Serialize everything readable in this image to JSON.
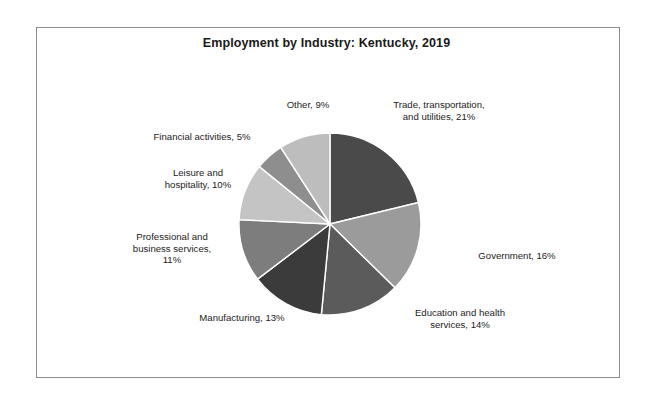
{
  "chart_data": {
    "type": "pie",
    "title": "Employment by Industry: Kentucky, 2019",
    "xlabel": "",
    "ylabel": "",
    "legend_position": "none",
    "grid": false,
    "labels_outside": true,
    "start_angle_deg": 0,
    "direction": "clockwise",
    "categories": [
      "Trade, transportation, and utilities",
      "Government",
      "Education and health services",
      "Manufacturing",
      "Professional and business services",
      "Leisure and hospitality",
      "Financial activities",
      "Other"
    ],
    "values": [
      21,
      16,
      14,
      13,
      11,
      10,
      5,
      9
    ],
    "unit": "%",
    "slices": [
      {
        "name": "trade-transportation-utilities",
        "label": "Trade, transportation,\nand utilities, 21%",
        "category": "Trade, transportation, and utilities",
        "value": 21,
        "color": "#4a4a4a"
      },
      {
        "name": "government",
        "label": "Government, 16%",
        "category": "Government",
        "value": 16,
        "color": "#9b9b9b"
      },
      {
        "name": "education-health-services",
        "label": "Education and health\nservices, 14%",
        "category": "Education and health services",
        "value": 14,
        "color": "#5b5b5b"
      },
      {
        "name": "manufacturing",
        "label": "Manufacturing, 13%",
        "category": "Manufacturing",
        "value": 13,
        "color": "#3b3b3b"
      },
      {
        "name": "professional-business-services",
        "label": "Professional and\nbusiness services,\n11%",
        "category": "Professional and business services",
        "value": 11,
        "color": "#7d7d7d"
      },
      {
        "name": "leisure-hospitality",
        "label": "Leisure and\nhospitality, 10%",
        "category": "Leisure and hospitality",
        "value": 10,
        "color": "#c4c4c4"
      },
      {
        "name": "financial-activities",
        "label": "Financial activities, 5%",
        "category": "Financial activities",
        "value": 5,
        "color": "#8e8e8e"
      },
      {
        "name": "other",
        "label": "Other, 9%",
        "category": "Other",
        "value": 9,
        "color": "#bdbdbd"
      }
    ]
  },
  "geometry": {
    "center_x": 330,
    "center_y": 224,
    "radius": 91,
    "separator_color": "#ffffff",
    "frame_color": "#8c8c8c",
    "background": "#ffffff"
  }
}
